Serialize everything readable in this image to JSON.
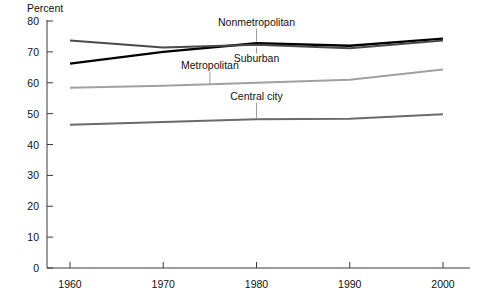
{
  "chart_data": {
    "type": "line",
    "title": "",
    "xlabel": "",
    "ylabel": "Percent",
    "ylim": [
      0,
      80
    ],
    "xlim": [
      1960,
      2000
    ],
    "grid": false,
    "legend_position": "inline-labels",
    "x": [
      1960,
      1970,
      1980,
      1990,
      2000
    ],
    "x_ticklabels": [
      "1960",
      "1970",
      "1980",
      "1990",
      "2000"
    ],
    "y_ticks": [
      0,
      10,
      20,
      30,
      40,
      50,
      60,
      70,
      80
    ],
    "y_ticklabels": [
      "0",
      "10",
      "20",
      "30",
      "40",
      "50",
      "60",
      "70",
      "80"
    ],
    "series": [
      {
        "name": "Nonmetropolitan",
        "color": "#000000",
        "width": 2.4,
        "values": [
          66.2,
          70.0,
          72.8,
          72.0,
          74.3
        ],
        "label": "Nonmetropolitan",
        "label_x": 1980,
        "label_y_pct": 78.5,
        "leader_to_pct": 73.4
      },
      {
        "name": "Suburban",
        "color": "#4a4a4a",
        "width": 2.0,
        "values": [
          73.7,
          71.4,
          72.3,
          71.2,
          73.7
        ],
        "label": "Suburban",
        "label_x": 1980,
        "label_y_pct": 66.6,
        "leader_to_pct": 71.5
      },
      {
        "name": "Metropolitan",
        "color": "#a0a0a0",
        "width": 2.0,
        "values": [
          58.4,
          59.0,
          60.0,
          61.0,
          64.3
        ],
        "label": "Metropolitan",
        "label_x": 1975,
        "label_y_pct": 64.5,
        "leader_to_pct": 59.6
      },
      {
        "name": "Central city",
        "color": "#6a6a6a",
        "width": 2.0,
        "values": [
          46.4,
          47.3,
          48.2,
          48.3,
          49.8
        ],
        "label": "Central city",
        "label_x": 1980,
        "label_y_pct": 54.5,
        "leader_to_pct": 48.6
      }
    ]
  },
  "axis": {
    "y_axis_title": "Percent"
  }
}
